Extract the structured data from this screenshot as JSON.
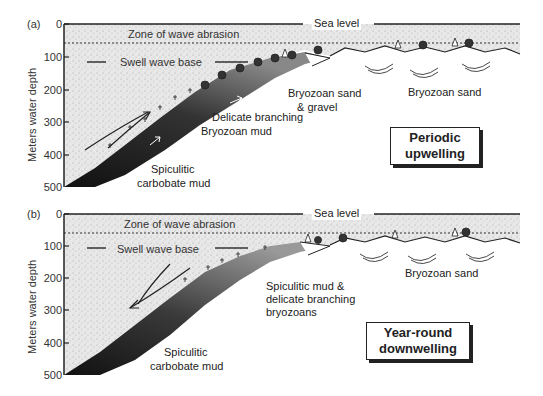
{
  "axis": {
    "ylabel": "Meters water depth",
    "ticks": [
      "0",
      "100",
      "200",
      "300",
      "400",
      "500"
    ]
  },
  "panel_a": {
    "letter": "(a)",
    "sea_level": "Sea level",
    "zone_of_wave_abrasion": "Zone of wave abrasion",
    "swell_wave_base": "Swell wave base",
    "labels": {
      "bryozoan_sand_gravel_1": "Bryozoan sand",
      "bryozoan_sand_gravel_2": "& gravel",
      "bryozoan_sand": "Bryozoan sand",
      "delicate_branching_1": "Delicate branching",
      "delicate_branching_2": "Bryozoan mud",
      "spiculitic_1": "Spiculitic",
      "spiculitic_2": "carbobate mud"
    },
    "box_line1": "Periodic",
    "box_line2": "upwelling"
  },
  "panel_b": {
    "letter": "(b)",
    "sea_level": "Sea level",
    "zone_of_wave_abrasion": "Zone of wave abrasion",
    "swell_wave_base": "Swell wave base",
    "labels": {
      "bryozoan_sand": "Bryozoan sand",
      "spiculitic_mud_1": "Spiculitic mud &",
      "spiculitic_mud_2": "delicate branching",
      "spiculitic_mud_3": "bryozoans",
      "spiculitic_1": "Spiculitic",
      "spiculitic_2": "carbobate mud"
    },
    "box_line1": "Year-round",
    "box_line2": "downwelling"
  },
  "colors": {
    "water": "#e4e4e4",
    "sediment_dark": "#1e1e1e",
    "sediment_mid": "#6a6a6a",
    "line": "#222222"
  }
}
